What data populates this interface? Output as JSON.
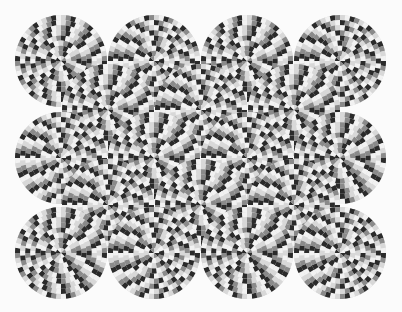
{
  "image": {
    "subject": "rotating snakes optical illusion",
    "width": 402,
    "height": 312,
    "background": "#fbfbfb",
    "colors": {
      "dark": "#2a2a2a",
      "light": "#d8d8d8",
      "white": "#f2f2f2",
      "gray": "#8a8a8a"
    },
    "disc_radius": 46,
    "rings": 9,
    "segments_outer": 28,
    "discs": [
      {
        "cx": 61,
        "cy": 61
      },
      {
        "cx": 154,
        "cy": 61
      },
      {
        "cx": 247,
        "cy": 61
      },
      {
        "cx": 340,
        "cy": 61
      },
      {
        "cx": 108,
        "cy": 110
      },
      {
        "cx": 201,
        "cy": 110
      },
      {
        "cx": 294,
        "cy": 110
      },
      {
        "cx": 61,
        "cy": 158
      },
      {
        "cx": 154,
        "cy": 158
      },
      {
        "cx": 247,
        "cy": 158
      },
      {
        "cx": 340,
        "cy": 158
      },
      {
        "cx": 108,
        "cy": 205
      },
      {
        "cx": 201,
        "cy": 205
      },
      {
        "cx": 294,
        "cy": 205
      },
      {
        "cx": 61,
        "cy": 253
      },
      {
        "cx": 154,
        "cy": 253
      },
      {
        "cx": 247,
        "cy": 253
      },
      {
        "cx": 340,
        "cy": 253
      }
    ]
  }
}
